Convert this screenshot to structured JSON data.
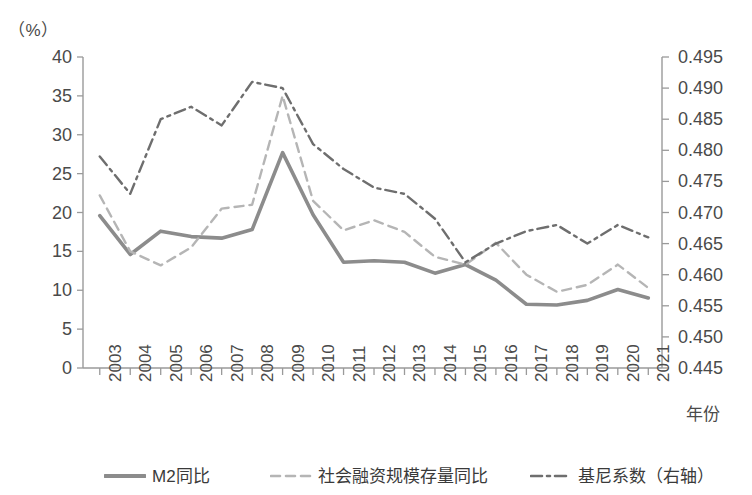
{
  "unit_label": "（%）",
  "axes": {
    "left_ticks": [
      "0",
      "5",
      "10",
      "15",
      "20",
      "25",
      "30",
      "35",
      "40"
    ],
    "right_ticks": [
      "0.445",
      "0.450",
      "0.455",
      "0.460",
      "0.465",
      "0.470",
      "0.475",
      "0.480",
      "0.485",
      "0.490",
      "0.495"
    ],
    "x_title": "年份"
  },
  "legend": {
    "items": [
      {
        "label": "M2同比",
        "style": "solid",
        "color": "#8c8c8c"
      },
      {
        "label": "社会融资规模存量同比",
        "style": "dashed",
        "color": "#b5b5b5"
      },
      {
        "label": "基尼系数（右轴）",
        "style": "dashdot",
        "color": "#6e6e6e"
      }
    ]
  },
  "chart_data": {
    "type": "line",
    "title": "",
    "subtitle": "",
    "xlabel": "年份",
    "ylabel": "（%）",
    "ylabel_right": "",
    "ylim": [
      0,
      40
    ],
    "ylim_right": [
      0.445,
      0.495
    ],
    "ytick_step": 5,
    "ytick_step_right": 0.005,
    "grid": false,
    "legend_position": "bottom",
    "categories": [
      "2003",
      "2004",
      "2005",
      "2006",
      "2007",
      "2008",
      "2009",
      "2010",
      "2011",
      "2012",
      "2013",
      "2014",
      "2015",
      "2016",
      "2017",
      "2018",
      "2019",
      "2020",
      "2021"
    ],
    "series": [
      {
        "name": "M2同比",
        "axis": "left",
        "style": "solid",
        "color": "#8c8c8c",
        "values": [
          19.6,
          14.6,
          17.6,
          16.9,
          16.7,
          17.8,
          27.7,
          19.7,
          13.6,
          13.8,
          13.6,
          12.2,
          13.3,
          11.3,
          8.2,
          8.1,
          8.7,
          10.1,
          9.0
        ]
      },
      {
        "name": "社会融资规模存量同比",
        "axis": "left",
        "style": "dashed",
        "color": "#b5b5b5",
        "values": [
          22.2,
          15.0,
          13.2,
          15.5,
          20.5,
          21.0,
          35.0,
          21.5,
          17.7,
          19.0,
          17.5,
          14.3,
          13.3,
          16.1,
          12.0,
          9.8,
          10.7,
          13.3,
          10.3
        ]
      },
      {
        "name": "基尼系数（右轴）",
        "axis": "right",
        "style": "dashdot",
        "color": "#6e6e6e",
        "values": [
          0.479,
          0.473,
          0.485,
          0.487,
          0.484,
          0.491,
          0.49,
          0.481,
          0.477,
          0.474,
          0.473,
          0.469,
          0.462,
          0.465,
          0.467,
          0.468,
          0.465,
          0.468,
          0.466
        ]
      }
    ]
  }
}
